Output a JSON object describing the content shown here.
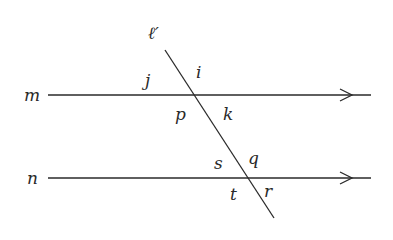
{
  "diagram": {
    "type": "parallel-lines-transversal",
    "colors": {
      "line": "#2a2a2a",
      "background": "#ffffff"
    },
    "lines": {
      "m": {
        "label": "m",
        "x1": 48,
        "y": 95,
        "x2": 371,
        "arrow_x": 352
      },
      "n": {
        "label": "n",
        "x1": 48,
        "y": 178,
        "x2": 371,
        "arrow_x": 352
      },
      "transversal": {
        "label": "ℓ′",
        "x1": 165,
        "y1": 50,
        "x2": 274,
        "y2": 218
      }
    },
    "angle_labels": {
      "j": "j",
      "i": "i",
      "p": "p",
      "k": "k",
      "s": "s",
      "q": "q",
      "t": "t",
      "r": "r"
    }
  }
}
